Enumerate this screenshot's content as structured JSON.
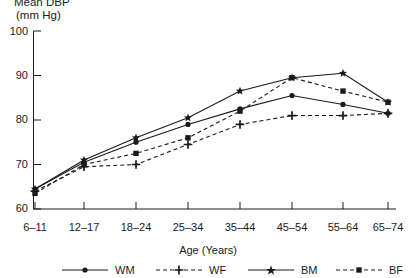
{
  "title": {
    "line1": "Mean DBP",
    "line2": "(mm Hg)"
  },
  "axes": {
    "x_label": "Age (Years)",
    "y_label": "Mean DBP (mm Hg)",
    "y_ticks": [
      "100",
      "90",
      "80",
      "70",
      "60"
    ],
    "x_ticks": [
      "6–11",
      "12–17",
      "18–24",
      "25–34",
      "35–44",
      "45–54",
      "55–64",
      "65–74"
    ]
  },
  "legend": {
    "items": [
      {
        "label": "WM",
        "style": "solid",
        "marker": "circle",
        "color": "#1a1a1a"
      },
      {
        "label": "WF",
        "style": "dashed",
        "marker": "plus",
        "color": "#1a1a1a"
      },
      {
        "label": "BM",
        "style": "solid",
        "marker": "star",
        "color": "#1a1a1a"
      },
      {
        "label": "BF",
        "style": "dashed",
        "marker": "square",
        "color": "#1a1a1a"
      }
    ]
  },
  "chart_data": {
    "type": "line",
    "title": "Mean DBP (mm Hg)",
    "xlabel": "Age (Years)",
    "ylabel": "Mean DBP (mm Hg)",
    "ylim": [
      60,
      100
    ],
    "ytick_values": [
      60,
      70,
      80,
      90,
      100
    ],
    "grid": false,
    "legend_position": "bottom",
    "categories": [
      "6–11",
      "12–17",
      "18–24",
      "25–34",
      "35–44",
      "45–54",
      "55–64",
      "65–74"
    ],
    "series": [
      {
        "name": "WM",
        "full_name": "White Male",
        "line_style": "solid",
        "marker": "circle",
        "values": [
          64.5,
          70.5,
          75.0,
          79.0,
          82.5,
          85.5,
          83.5,
          81.5
        ]
      },
      {
        "name": "WF",
        "full_name": "White Female",
        "line_style": "dashed",
        "marker": "plus",
        "values": [
          64.0,
          69.5,
          70.0,
          74.5,
          79.0,
          81.0,
          81.0,
          81.5
        ]
      },
      {
        "name": "BM",
        "full_name": "Black Male",
        "line_style": "solid",
        "marker": "star",
        "values": [
          64.5,
          71.0,
          76.0,
          80.5,
          86.5,
          89.5,
          90.5,
          84.0
        ]
      },
      {
        "name": "BF",
        "full_name": "Black Female",
        "line_style": "dashed",
        "marker": "square",
        "values": [
          63.5,
          70.0,
          72.5,
          76.0,
          82.0,
          89.5,
          86.5,
          84.0
        ]
      }
    ]
  }
}
